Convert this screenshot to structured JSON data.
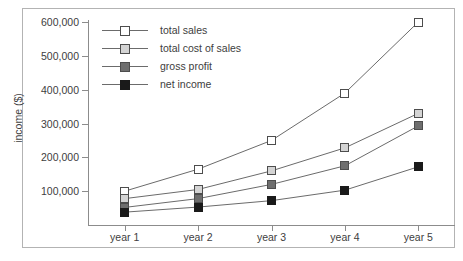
{
  "chart_data": {
    "type": "line",
    "title": "",
    "xlabel": "",
    "ylabel": "income ($)",
    "categories": [
      "year 1",
      "year 2",
      "year 3",
      "year 4",
      "year 5"
    ],
    "ylim": [
      0,
      620000
    ],
    "yticks": [
      100000,
      200000,
      300000,
      400000,
      500000,
      600000
    ],
    "ytick_labels": [
      "100,000",
      "200,000",
      "300,000",
      "400,000",
      "500,000",
      "600,000"
    ],
    "grid": false,
    "legend_position": "upper-left-inside",
    "series": [
      {
        "name": "total sales",
        "marker": "square-open",
        "color": "#ffffff",
        "edge_color": "#4d4d4d",
        "values": [
          100000,
          165000,
          250000,
          390000,
          600000
        ]
      },
      {
        "name": "total cost of sales",
        "marker": "square-light-gray",
        "color": "#d4d4d4",
        "edge_color": "#4d4d4d",
        "values": [
          78000,
          105000,
          160000,
          228000,
          330000
        ]
      },
      {
        "name": "gross profit",
        "marker": "square-dark-gray",
        "color": "#6e6e6e",
        "edge_color": "#4d4d4d",
        "values": [
          52000,
          78000,
          120000,
          175000,
          293000
        ]
      },
      {
        "name": "net income",
        "marker": "square-filled-black",
        "color": "#1a1a1a",
        "edge_color": "#1a1a1a",
        "values": [
          38000,
          53000,
          72000,
          103000,
          172000
        ]
      }
    ]
  },
  "axis": {
    "y_title": "income ($)"
  },
  "colors": {
    "axis": "#8c8c8c",
    "line": "#6b6b6b",
    "text": "#404040",
    "frame": "#b3b3b3"
  }
}
